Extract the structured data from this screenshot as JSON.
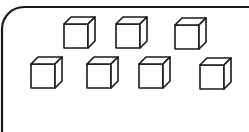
{
  "diagram": {
    "stroke_color": "#1a1a1a",
    "fill_color": "#ffffff",
    "frame": {
      "x": 2,
      "y": 7,
      "width": 270,
      "height": 150,
      "radius": 22
    },
    "cube_count": 7,
    "rows": [
      {
        "cubes": [
          {
            "x": 64,
            "y": 17
          },
          {
            "x": 116,
            "y": 17
          },
          {
            "x": 175,
            "y": 18
          }
        ]
      },
      {
        "cubes": [
          {
            "x": 31,
            "y": 57
          },
          {
            "x": 87,
            "y": 57
          },
          {
            "x": 139,
            "y": 57
          },
          {
            "x": 200,
            "y": 58
          }
        ]
      }
    ],
    "cube_size": {
      "face": 24,
      "depth": 7
    }
  }
}
